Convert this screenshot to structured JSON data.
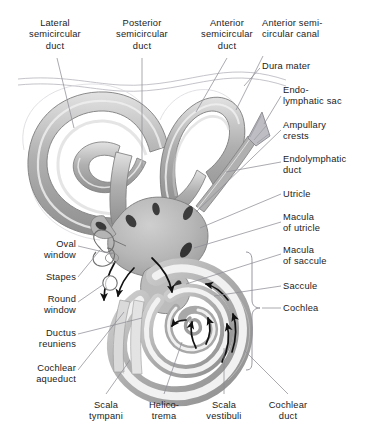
{
  "figure": {
    "kind": "anatomical-illustration",
    "background_color": "#ffffff",
    "ink_color": "#1b1b1b",
    "leader_line_color": "#8d8d96",
    "palette": {
      "outer_wall_light": "#dcdcdc",
      "wall_mid": "#a9a9a9",
      "wall_dark": "#8a8a8a",
      "duct_lumen": "#f0f0f0",
      "vestibule_fill": "#bdbdbd",
      "macula_dark": "#3a3a3a",
      "arrow_black": "#111111",
      "dura_line": "#b5b5bd"
    }
  },
  "labels": {
    "top": [
      {
        "id": "lateral-semicircular-duct",
        "lines": [
          "Lateral",
          "semicircular",
          "duct"
        ],
        "x": 12,
        "y": 18,
        "w": 86,
        "align": "center"
      },
      {
        "id": "posterior-semicircular-duct",
        "lines": [
          "Posterior",
          "semicircular",
          "duct"
        ],
        "x": 99,
        "y": 18,
        "w": 86,
        "align": "center"
      },
      {
        "id": "anterior-semicircular-duct",
        "lines": [
          "Anterior",
          "semicircular",
          "duct"
        ],
        "x": 186,
        "y": 18,
        "w": 82,
        "align": "center"
      },
      {
        "id": "anterior-semicircular-canal",
        "lines": [
          "Anterior semi-",
          "circular canal"
        ],
        "x": 262,
        "y": 18,
        "w": 104,
        "align": "left"
      }
    ],
    "right": [
      {
        "id": "dura-mater",
        "lines": [
          "Dura mater"
        ],
        "x": 262,
        "y": 61,
        "w": 110,
        "align": "left"
      },
      {
        "id": "endolymphatic-sac",
        "lines": [
          "Endo-",
          "lymphatic sac"
        ],
        "x": 283,
        "y": 85,
        "w": 94,
        "align": "left"
      },
      {
        "id": "ampullary-crests",
        "lines": [
          "Ampullary",
          "crests"
        ],
        "x": 283,
        "y": 120,
        "w": 94,
        "align": "left"
      },
      {
        "id": "endolymphatic-duct",
        "lines": [
          "Endolymphatic",
          "duct"
        ],
        "x": 283,
        "y": 154,
        "w": 94,
        "align": "left"
      },
      {
        "id": "utricle",
        "lines": [
          "Utricle"
        ],
        "x": 283,
        "y": 189,
        "w": 94,
        "align": "left"
      },
      {
        "id": "macula-of-utricle",
        "lines": [
          "Macula",
          "of utricle"
        ],
        "x": 283,
        "y": 212,
        "w": 94,
        "align": "left"
      },
      {
        "id": "macula-of-saccule",
        "lines": [
          "Macula",
          "of saccule"
        ],
        "x": 283,
        "y": 245,
        "w": 94,
        "align": "left"
      },
      {
        "id": "saccule",
        "lines": [
          "Saccule"
        ],
        "x": 283,
        "y": 281,
        "w": 94,
        "align": "left"
      },
      {
        "id": "cochlea",
        "lines": [
          "Cochlea"
        ],
        "x": 283,
        "y": 303,
        "w": 94,
        "align": "left"
      }
    ],
    "left": [
      {
        "id": "oval-window",
        "lines": [
          "Oval",
          "window"
        ],
        "x": 8,
        "y": 239,
        "w": 68,
        "align": "right"
      },
      {
        "id": "stapes",
        "lines": [
          "Stapes"
        ],
        "x": 8,
        "y": 272,
        "w": 68,
        "align": "right"
      },
      {
        "id": "round-window",
        "lines": [
          "Round",
          "window"
        ],
        "x": 8,
        "y": 294,
        "w": 68,
        "align": "right"
      },
      {
        "id": "ductus-reuniens",
        "lines": [
          "Ductus",
          "reuniens"
        ],
        "x": 8,
        "y": 328,
        "w": 68,
        "align": "right"
      },
      {
        "id": "cochlear-aqueduct",
        "lines": [
          "Cochlear",
          "aqueduct"
        ],
        "x": 2,
        "y": 363,
        "w": 74,
        "align": "right"
      }
    ],
    "bottom": [
      {
        "id": "scala-tympani",
        "lines": [
          "Scala",
          "tympani"
        ],
        "x": 78,
        "y": 400,
        "w": 56,
        "align": "center"
      },
      {
        "id": "helicotrema",
        "lines": [
          "Helico-",
          "trema"
        ],
        "x": 137,
        "y": 400,
        "w": 54,
        "align": "center"
      },
      {
        "id": "scala-vestibuli",
        "lines": [
          "Scala",
          "vestibuli"
        ],
        "x": 194,
        "y": 400,
        "w": 60,
        "align": "center"
      },
      {
        "id": "cochlear-duct",
        "lines": [
          "Cochlear",
          "duct"
        ],
        "x": 257,
        "y": 400,
        "w": 62,
        "align": "center"
      }
    ]
  },
  "structures": {
    "lateral_semicircular_duct": "large left loop of the labyrinth",
    "posterior_semicircular_duct": "lower-left loop running down to the vestibule",
    "anterior_semicircular_duct": "right-hand loop of the labyrinth",
    "vestibule": "central bulbous chamber containing utricle and saccule",
    "cochlea": "spiral of about two and a half turns, lower right",
    "endolymphatic_sac": "small triangular expansion at the upper right end of the endolymphatic duct",
    "stapes": "stirrup outline set in the oval window",
    "round_window": "small circular opening below the oval window",
    "arrows": "black arrows indicating the direction of fluid wave travel from oval window through scala vestibuli, around the helicotrema and back along scala tympani to the round window"
  }
}
